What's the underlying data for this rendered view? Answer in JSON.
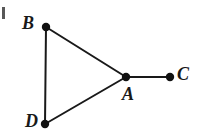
{
  "figure": {
    "background_color": "#ffffff",
    "ink_color": "#191919",
    "width": 198,
    "height": 136,
    "cropped_left_fragment": {
      "present": true,
      "description": "partial-glyph-clipped-at-left-edge"
    }
  },
  "chart_data": {
    "type": "diagram",
    "title": "",
    "xlabel": "",
    "ylabel": "",
    "nodes": [
      {
        "id": "B",
        "label": "B",
        "x": 46,
        "y": 27,
        "label_x": 22,
        "label_y": 14,
        "radius": 4.2
      },
      {
        "id": "D",
        "label": "D",
        "x": 45,
        "y": 124,
        "label_x": 25,
        "label_y": 112,
        "radius": 4.2
      },
      {
        "id": "A",
        "label": "A",
        "x": 126,
        "y": 77,
        "label_x": 122,
        "label_y": 85,
        "radius": 4.2
      },
      {
        "id": "C",
        "label": "C",
        "x": 170,
        "y": 77,
        "label_x": 177,
        "label_y": 65,
        "radius": 4.2
      }
    ],
    "edges": [
      {
        "id": "edge-B-D",
        "from": "B",
        "to": "D",
        "x1": 46,
        "y1": 27,
        "x2": 45,
        "y2": 124
      },
      {
        "id": "edge-B-A",
        "from": "B",
        "to": "A",
        "x1": 46,
        "y1": 27,
        "x2": 126,
        "y2": 77
      },
      {
        "id": "edge-D-A",
        "from": "D",
        "to": "A",
        "x1": 45,
        "y1": 124,
        "x2": 126,
        "y2": 77
      },
      {
        "id": "edge-A-C",
        "from": "A",
        "to": "C",
        "x1": 126,
        "y1": 77,
        "x2": 170,
        "y2": 77
      }
    ],
    "edge_stroke_width": 2,
    "legend": [],
    "annotations": []
  },
  "labels": {
    "node_a": "A",
    "node_b": "B",
    "node_c": "C",
    "node_d": "D"
  }
}
